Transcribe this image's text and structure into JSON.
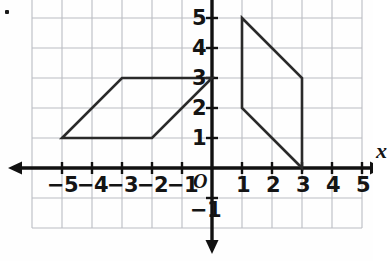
{
  "figure": {
    "kind": "coordinate-plane",
    "background": "#fefefe",
    "grid_color": "#b9bcc2",
    "axis_color": "#111111",
    "shape_color": "#2a2a2a"
  },
  "axes": {
    "x_label": "x",
    "y_label": "y",
    "origin_label": "O",
    "x_min": -6,
    "x_max": 5,
    "y_min": -2,
    "y_max": 6,
    "x_tick_labels": [
      "−5",
      "−4",
      "−3",
      "−2",
      "−1",
      "1",
      "2",
      "3",
      "4",
      "5"
    ],
    "x_tick_values": [
      -5,
      -4,
      -3,
      -2,
      -1,
      1,
      2,
      3,
      4,
      5
    ],
    "y_tick_labels": [
      "5",
      "4",
      "3",
      "2",
      "1",
      "−1"
    ],
    "y_tick_values": [
      5,
      4,
      3,
      2,
      1,
      -1
    ]
  },
  "chart_data": {
    "type": "scatter",
    "title": "",
    "xlabel": "x",
    "ylabel": "y",
    "xlim": [
      -6,
      5
    ],
    "ylim": [
      -2,
      6
    ],
    "grid": true,
    "legend": "none",
    "shapes": [
      {
        "name": "left-parallelogram",
        "closed": true,
        "vertices": [
          [
            -5,
            1
          ],
          [
            -2,
            1
          ],
          [
            0,
            3
          ],
          [
            -3,
            3
          ]
        ]
      },
      {
        "name": "right-parallelogram",
        "closed": true,
        "vertices": [
          [
            1,
            5
          ],
          [
            3,
            3
          ],
          [
            3,
            0
          ],
          [
            1,
            2
          ]
        ]
      }
    ]
  },
  "marks": {
    "corner_dot": "decorative-dot"
  }
}
